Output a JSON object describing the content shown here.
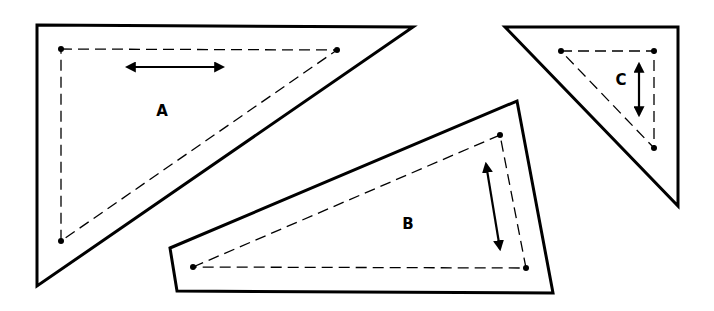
{
  "diagram": {
    "colors": {
      "stroke": "#000000",
      "background": "#ffffff"
    },
    "shapes": [
      {
        "id": "A",
        "label": "A",
        "label_pos": [
          162,
          116
        ],
        "outer": "37,25 413,27 37,286",
        "inner": "61,49 337,50 61,241",
        "dots": [
          [
            61,
            49
          ],
          [
            337,
            50
          ],
          [
            61,
            241
          ]
        ],
        "arrow": {
          "x1": 127,
          "y1": 67,
          "x2": 223,
          "y2": 67,
          "orientation": "horizontal"
        }
      },
      {
        "id": "B",
        "label": "B",
        "label_pos": [
          408,
          229
        ],
        "outer": "170,248 517,101 553,293 177,291",
        "inner": "193,267 500,135 526,268",
        "dots": [
          [
            193,
            267
          ],
          [
            500,
            135
          ],
          [
            526,
            268
          ]
        ],
        "arrow": {
          "x1": 486,
          "y1": 164,
          "x2": 500,
          "y2": 249,
          "orientation": "vertical"
        }
      },
      {
        "id": "C",
        "label": "C",
        "label_pos": [
          621,
          85
        ],
        "outer": "505,27 678,27 678,206",
        "inner": "561,51 654,51 654,148",
        "dots": [
          [
            561,
            51
          ],
          [
            654,
            51
          ],
          [
            654,
            148
          ]
        ],
        "arrow": {
          "x1": 639,
          "y1": 64,
          "x2": 639,
          "y2": 115,
          "orientation": "vertical"
        }
      }
    ]
  }
}
